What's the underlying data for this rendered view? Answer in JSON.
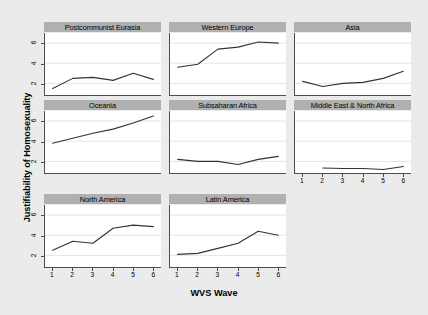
{
  "chart_data": {
    "type": "line",
    "title": "",
    "xlabel": "WVS Wave",
    "ylabel": "Justifiability of Homosexuality",
    "x": [
      1,
      2,
      3,
      4,
      5,
      6
    ],
    "xtick_labels": [
      "1",
      "2",
      "3",
      "4",
      "5",
      "6"
    ],
    "ytick_labels": [
      "2",
      "4",
      "6"
    ],
    "yticks": [
      2,
      4,
      6
    ],
    "xlim": [
      0.62,
      6.38
    ],
    "ylim": [
      0.85,
      7.0
    ],
    "grid": "horizontal",
    "legend": "none",
    "layout": "3x3 small multiples, 8 panels, bottom-right cell empty",
    "line_color": "#333333",
    "panel_title_bg": "#b0b0b0",
    "figure_bg": "#ebebeb",
    "panel_bg": "#ffffff",
    "panels": [
      {
        "name": "Postcommunist Eurasia",
        "values": [
          1.5,
          2.5,
          2.6,
          2.3,
          3.0,
          2.4
        ],
        "show_xaxis": false
      },
      {
        "name": "Western Europe",
        "values": [
          3.6,
          3.9,
          5.4,
          5.6,
          6.1,
          6.0
        ],
        "show_xaxis": false
      },
      {
        "name": "Asia",
        "values": [
          2.2,
          1.7,
          2.0,
          2.1,
          2.5,
          3.2
        ],
        "show_xaxis": false
      },
      {
        "name": "Oceania",
        "values": [
          3.8,
          4.3,
          4.8,
          5.2,
          5.8,
          6.5
        ],
        "show_xaxis": false
      },
      {
        "name": "Subsaharan Africa",
        "values": [
          2.2,
          2.0,
          2.0,
          1.7,
          2.2,
          2.5
        ],
        "show_xaxis": false
      },
      {
        "name": "Middle East & North Africa",
        "values": [
          null,
          1.35,
          1.3,
          1.3,
          1.2,
          1.5
        ],
        "show_xaxis": true
      },
      {
        "name": "North America",
        "values": [
          2.5,
          3.4,
          3.2,
          4.7,
          5.0,
          4.85
        ],
        "show_xaxis": true
      },
      {
        "name": "Latin America",
        "values": [
          2.1,
          2.2,
          2.7,
          3.2,
          4.4,
          4.0
        ],
        "show_xaxis": true
      }
    ]
  }
}
